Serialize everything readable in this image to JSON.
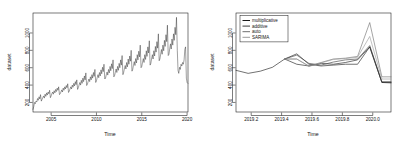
{
  "figure": {
    "background": "#ffffff",
    "panel_count": 2
  },
  "chart_data": [
    {
      "panel": "left",
      "type": "line",
      "title": "",
      "xlabel": "Time",
      "ylabel": "dataset",
      "xlim": [
        2003.0,
        2020.1
      ],
      "ylim": [
        90,
        1230
      ],
      "xticks": [
        2005,
        2010,
        2015,
        2020
      ],
      "xtick_labels": [
        "2005",
        "2010",
        "2015",
        "2020"
      ],
      "yticks": [
        200,
        400,
        600,
        800,
        1000
      ],
      "ytick_labels": [
        "200",
        "400",
        "600",
        "800",
        "1000"
      ],
      "grid": false,
      "legend": null,
      "series": [
        {
          "name": "dataset",
          "color": "#1a1a1a",
          "x": [
            2003.0,
            2003.08,
            2003.17,
            2003.25,
            2003.33,
            2003.42,
            2003.5,
            2003.58,
            2003.67,
            2003.75,
            2003.83,
            2003.92,
            2004.0,
            2004.08,
            2004.17,
            2004.25,
            2004.33,
            2004.42,
            2004.5,
            2004.58,
            2004.67,
            2004.75,
            2004.83,
            2004.92,
            2005.0,
            2005.08,
            2005.17,
            2005.25,
            2005.33,
            2005.42,
            2005.5,
            2005.58,
            2005.67,
            2005.75,
            2005.83,
            2005.92,
            2006.0,
            2006.08,
            2006.17,
            2006.25,
            2006.33,
            2006.42,
            2006.5,
            2006.58,
            2006.67,
            2006.75,
            2006.83,
            2006.92,
            2007.0,
            2007.08,
            2007.17,
            2007.25,
            2007.33,
            2007.42,
            2007.5,
            2007.58,
            2007.67,
            2007.75,
            2007.83,
            2007.92,
            2008.0,
            2008.08,
            2008.17,
            2008.25,
            2008.33,
            2008.42,
            2008.5,
            2008.58,
            2008.67,
            2008.75,
            2008.83,
            2008.92,
            2009.0,
            2009.08,
            2009.17,
            2009.25,
            2009.33,
            2009.42,
            2009.5,
            2009.58,
            2009.67,
            2009.75,
            2009.83,
            2009.92,
            2010.0,
            2010.08,
            2010.17,
            2010.25,
            2010.33,
            2010.42,
            2010.5,
            2010.58,
            2010.67,
            2010.75,
            2010.83,
            2010.92,
            2011.0,
            2011.08,
            2011.17,
            2011.25,
            2011.33,
            2011.42,
            2011.5,
            2011.58,
            2011.67,
            2011.75,
            2011.83,
            2011.92,
            2012.0,
            2012.08,
            2012.17,
            2012.25,
            2012.33,
            2012.42,
            2012.5,
            2012.58,
            2012.67,
            2012.75,
            2012.83,
            2012.92,
            2013.0,
            2013.08,
            2013.17,
            2013.25,
            2013.33,
            2013.42,
            2013.5,
            2013.58,
            2013.67,
            2013.75,
            2013.83,
            2013.92,
            2014.0,
            2014.08,
            2014.17,
            2014.25,
            2014.33,
            2014.42,
            2014.5,
            2014.58,
            2014.67,
            2014.75,
            2014.83,
            2014.92,
            2015.0,
            2015.08,
            2015.17,
            2015.25,
            2015.33,
            2015.42,
            2015.5,
            2015.58,
            2015.67,
            2015.75,
            2015.83,
            2015.92,
            2016.0,
            2016.08,
            2016.17,
            2016.25,
            2016.33,
            2016.42,
            2016.5,
            2016.58,
            2016.67,
            2016.75,
            2016.83,
            2016.92,
            2017.0,
            2017.08,
            2017.17,
            2017.25,
            2017.33,
            2017.42,
            2017.5,
            2017.58,
            2017.67,
            2017.75,
            2017.83,
            2017.92,
            2018.0,
            2018.08,
            2018.17,
            2018.25,
            2018.33,
            2018.42,
            2018.5,
            2018.58,
            2018.67,
            2018.75,
            2018.83,
            2018.92,
            2019.0,
            2019.08,
            2019.17,
            2019.25,
            2019.33,
            2019.42,
            2019.5,
            2019.58,
            2019.67,
            2019.75,
            2019.83,
            2019.92,
            2020.0,
            2020.08
          ],
          "values": [
            120,
            150,
            200,
            185,
            215,
            205,
            245,
            225,
            265,
            240,
            290,
            215,
            235,
            255,
            275,
            250,
            295,
            270,
            310,
            285,
            320,
            300,
            340,
            255,
            275,
            300,
            320,
            295,
            335,
            310,
            350,
            325,
            365,
            340,
            380,
            290,
            300,
            320,
            345,
            320,
            365,
            340,
            380,
            355,
            395,
            370,
            415,
            315,
            330,
            355,
            380,
            355,
            400,
            375,
            420,
            390,
            440,
            405,
            460,
            350,
            370,
            400,
            430,
            400,
            455,
            420,
            480,
            440,
            505,
            460,
            540,
            395,
            410,
            440,
            470,
            440,
            495,
            460,
            520,
            480,
            545,
            500,
            580,
            430,
            450,
            485,
            520,
            485,
            545,
            505,
            575,
            530,
            605,
            555,
            640,
            470,
            480,
            515,
            550,
            515,
            580,
            540,
            615,
            565,
            645,
            590,
            690,
            495,
            510,
            545,
            585,
            545,
            615,
            570,
            650,
            600,
            690,
            630,
            740,
            520,
            545,
            585,
            625,
            585,
            660,
            610,
            700,
            640,
            735,
            675,
            800,
            560,
            580,
            625,
            670,
            625,
            705,
            655,
            750,
            690,
            790,
            725,
            860,
            600,
            615,
            660,
            705,
            660,
            750,
            695,
            795,
            730,
            840,
            770,
            910,
            630,
            650,
            700,
            750,
            700,
            795,
            735,
            845,
            780,
            900,
            825,
            990,
            680,
            700,
            755,
            810,
            755,
            860,
            795,
            915,
            845,
            980,
            900,
            1090,
            740,
            755,
            815,
            875,
            815,
            930,
            860,
            990,
            915,
            1065,
            980,
            1180,
            800,
            570,
            535,
            605,
            580,
            640,
            620,
            660,
            640,
            690,
            810,
            840,
            480,
            430,
            420
          ]
        }
      ]
    },
    {
      "panel": "right",
      "type": "line",
      "title": "",
      "xlabel": "Time",
      "ylabel": "dataset",
      "xlim": [
        2019.1,
        2020.12
      ],
      "ylim": [
        90,
        1230
      ],
      "xticks": [
        2019.2,
        2019.4,
        2019.6,
        2019.8,
        2020.0
      ],
      "xtick_labels": [
        "2019.2",
        "2019.4",
        "2019.6",
        "2019.8",
        "2020.0"
      ],
      "yticks": [
        200,
        400,
        600,
        800,
        1000
      ],
      "ytick_labels": [
        "200",
        "400",
        "600",
        "800",
        "1000"
      ],
      "grid": false,
      "legend": {
        "position": "top-left",
        "entries": [
          {
            "label": "multiplicative",
            "color": "#1a1a1a"
          },
          {
            "label": "additive",
            "color": "#3d3d3d"
          },
          {
            "label": "auto",
            "color": "#6e6e6e"
          },
          {
            "label": "SARIMA",
            "color": "#9a9a9a"
          }
        ]
      },
      "series": [
        {
          "name": "observed",
          "color": "#1a1a1a",
          "x": [
            2019.1,
            2019.18,
            2019.26,
            2019.34,
            2019.42,
            2019.5,
            2019.58,
            2019.66,
            2019.74,
            2019.82,
            2019.9,
            2019.98,
            2020.06,
            2020.12
          ],
          "values": [
            570,
            535,
            560,
            605,
            700,
            640,
            620,
            650,
            640,
            660,
            690,
            840,
            430,
            425
          ]
        },
        {
          "name": "multiplicative",
          "color": "#1a1a1a",
          "x": [
            2019.42,
            2019.5,
            2019.58,
            2019.66,
            2019.74,
            2019.82,
            2019.9,
            2019.98,
            2020.06,
            2020.12
          ],
          "values": [
            700,
            760,
            640,
            620,
            630,
            640,
            640,
            840,
            430,
            430
          ]
        },
        {
          "name": "additive",
          "color": "#3d3d3d",
          "x": [
            2019.42,
            2019.5,
            2019.58,
            2019.66,
            2019.74,
            2019.82,
            2019.9,
            2019.98,
            2020.06,
            2020.12
          ],
          "values": [
            700,
            745,
            650,
            630,
            665,
            690,
            700,
            855,
            440,
            440
          ]
        },
        {
          "name": "auto",
          "color": "#6e6e6e",
          "x": [
            2019.42,
            2019.5,
            2019.58,
            2019.66,
            2019.74,
            2019.82,
            2019.9,
            2019.98,
            2020.06,
            2020.12
          ],
          "values": [
            700,
            700,
            620,
            660,
            700,
            710,
            730,
            1120,
            495,
            495
          ]
        },
        {
          "name": "SARIMA",
          "color": "#9a9a9a",
          "x": [
            2019.42,
            2019.5,
            2019.58,
            2019.66,
            2019.74,
            2019.82,
            2019.9,
            2019.98,
            2020.06,
            2020.12
          ],
          "values": [
            700,
            700,
            615,
            655,
            695,
            705,
            720,
            960,
            470,
            470
          ]
        }
      ]
    }
  ]
}
